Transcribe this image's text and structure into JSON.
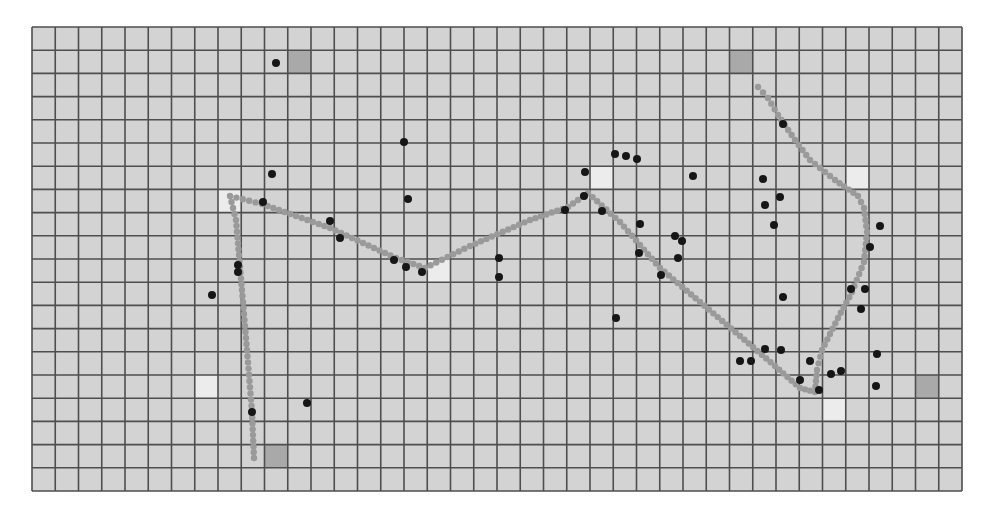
{
  "grid": {
    "cols": 40,
    "rows": 20,
    "origin_x": 32,
    "origin_y": 27,
    "cell_w": 23.25,
    "cell_h": 23.2,
    "background_color": "#d3d3d3",
    "line_color": "#4e4e4e",
    "line_width": 1.6
  },
  "special_cells": {
    "dark": {
      "color": "#a9a9a9",
      "cells": [
        [
          11,
          1
        ],
        [
          30,
          1
        ],
        [
          10,
          18
        ],
        [
          38,
          15
        ]
      ]
    },
    "light": {
      "color": "#ececec",
      "cells": [
        [
          8,
          7
        ],
        [
          17,
          10
        ],
        [
          24,
          6
        ],
        [
          35,
          6
        ],
        [
          7,
          15
        ],
        [
          34,
          16
        ]
      ]
    }
  },
  "path": {
    "color": "#9a9a9a",
    "point_radius": 3.2,
    "spacing": 6,
    "polylines": [
      [
        [
          254,
          458
        ],
        [
          252,
          412
        ],
        [
          247,
          350
        ],
        [
          242,
          290
        ],
        [
          239,
          255
        ],
        [
          236,
          220
        ],
        [
          230,
          196
        ],
        [
          262,
          204
        ],
        [
          330,
          228
        ],
        [
          396,
          258
        ],
        [
          425,
          268
        ],
        [
          470,
          246
        ],
        [
          530,
          220
        ],
        [
          568,
          207
        ],
        [
          588,
          193
        ],
        [
          620,
          222
        ],
        [
          660,
          268
        ],
        [
          700,
          302
        ],
        [
          740,
          336
        ],
        [
          775,
          366
        ],
        [
          800,
          388
        ],
        [
          815,
          392
        ],
        [
          817,
          370
        ],
        [
          822,
          350
        ],
        [
          838,
          318
        ],
        [
          852,
          292
        ],
        [
          864,
          262
        ],
        [
          867,
          232
        ],
        [
          864,
          208
        ],
        [
          858,
          196
        ],
        [
          835,
          180
        ],
        [
          810,
          160
        ],
        [
          795,
          140
        ],
        [
          778,
          115
        ],
        [
          768,
          98
        ],
        [
          758,
          87
        ]
      ]
    ]
  },
  "dots": {
    "color": "#161616",
    "radius": 4,
    "points": [
      [
        276,
        63
      ],
      [
        404,
        142
      ],
      [
        272,
        174
      ],
      [
        263,
        202
      ],
      [
        408,
        199
      ],
      [
        330,
        221
      ],
      [
        340,
        238
      ],
      [
        394,
        260
      ],
      [
        406,
        267
      ],
      [
        422,
        272
      ],
      [
        499,
        258
      ],
      [
        499,
        277
      ],
      [
        238,
        265
      ],
      [
        238,
        272
      ],
      [
        212,
        295
      ],
      [
        252,
        412
      ],
      [
        307,
        403
      ],
      [
        615,
        154
      ],
      [
        626,
        156
      ],
      [
        637,
        159
      ],
      [
        585,
        172
      ],
      [
        693,
        176
      ],
      [
        584,
        196
      ],
      [
        565,
        210
      ],
      [
        602,
        211
      ],
      [
        640,
        224
      ],
      [
        675,
        236
      ],
      [
        682,
        241
      ],
      [
        639,
        253
      ],
      [
        678,
        258
      ],
      [
        661,
        275
      ],
      [
        616,
        318
      ],
      [
        783,
        124
      ],
      [
        763,
        179
      ],
      [
        780,
        197
      ],
      [
        765,
        205
      ],
      [
        774,
        225
      ],
      [
        880,
        226
      ],
      [
        870,
        247
      ],
      [
        851,
        289
      ],
      [
        865,
        289
      ],
      [
        861,
        309
      ],
      [
        783,
        297
      ],
      [
        765,
        349
      ],
      [
        781,
        350
      ],
      [
        740,
        361
      ],
      [
        751,
        361
      ],
      [
        810,
        361
      ],
      [
        877,
        354
      ],
      [
        831,
        374
      ],
      [
        841,
        371
      ],
      [
        800,
        380
      ],
      [
        876,
        386
      ],
      [
        819,
        390
      ]
    ]
  },
  "labels": {
    "figure": "Agent trajectory over grid world"
  }
}
